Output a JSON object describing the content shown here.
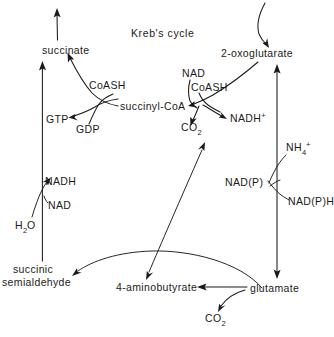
{
  "figure": {
    "title": "Kreb's cycle",
    "type": "biochemical-pathway-diagram",
    "background_color": "#ffffff",
    "ink_color": "#1a1a1a"
  },
  "metabolites": {
    "succinate": "succinate",
    "two_oxoglutarate": "2-oxoglutarate",
    "succinyl_coa": "succinyl-CoA",
    "coash_left": "CoASH",
    "coash_right": "CoASH",
    "gtp": "GTP",
    "gdp": "GDP",
    "nad_top": "NAD",
    "nadh_plus_base": "NADH",
    "nadh_plus_sup": "+",
    "co2_upper_base": "CO",
    "co2_upper_sub": "2",
    "nadh_left": "NADH",
    "nad_left": "NAD",
    "h2o_base": "H",
    "h2o_sub": "2",
    "h2o_tail": "O",
    "nh4_base": "NH",
    "nh4_sub": "4",
    "nh4_sup": "+",
    "nadp": "NAD(P)",
    "nadph": "NAD(P)H",
    "succinic_line1": "succinic",
    "succinic_line2": "semialdehyde",
    "four_aminobutyrate": "4-aminobutyrate",
    "glutamate": "glutamate",
    "co2_lower_base": "CO",
    "co2_lower_sub": "2"
  }
}
